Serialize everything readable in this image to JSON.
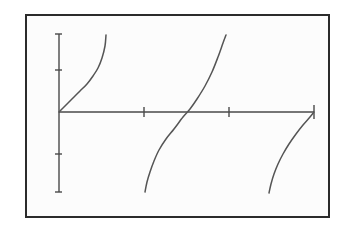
{
  "figure": {
    "name": "tangent-function-graph",
    "background_color": "#ffffff",
    "plot_background_color": "#fcfcfc",
    "border_color": "#2b2b2b",
    "axis_color": "#4a4a4a",
    "curve_color": "#555555",
    "title": "",
    "subtitle": "",
    "caption": ""
  },
  "chart_data": {
    "type": "line",
    "title": "",
    "xlabel": "",
    "ylabel": "",
    "grid": false,
    "legend": false,
    "legend_position": "none",
    "xlim": [
      0,
      4.7124
    ],
    "ylim": [
      -4,
      6
    ],
    "x_ticks": [
      0,
      1.5708,
      3.1416,
      4.7124
    ],
    "x_tick_labels": [
      "",
      "",
      "",
      ""
    ],
    "y_ticks": [
      -2,
      0,
      2
    ],
    "y_tick_labels": [
      "",
      "",
      ""
    ],
    "axis_origin_px": {
      "x": 32,
      "y": 96
    },
    "x_axis_span_px": {
      "start": 32,
      "end": 287
    },
    "y_axis_span_px": {
      "top": 18,
      "bottom": 176
    },
    "series": [
      {
        "name": "tangent-branch-1",
        "description": "rising branch from origin toward vertical asymptote",
        "points_px": [
          [
            32,
            96
          ],
          [
            36,
            92
          ],
          [
            41,
            87
          ],
          [
            47,
            81
          ],
          [
            53,
            75
          ],
          [
            60,
            68
          ],
          [
            66,
            60
          ],
          [
            71,
            52
          ],
          [
            75,
            42
          ],
          [
            78,
            30
          ],
          [
            79,
            19
          ]
        ]
      },
      {
        "name": "tangent-branch-2",
        "description": "full branch crossing the x-axis at pi",
        "points_px": [
          [
            118,
            176
          ],
          [
            120,
            166
          ],
          [
            123,
            156
          ],
          [
            127,
            145
          ],
          [
            132,
            134
          ],
          [
            139,
            123
          ],
          [
            147,
            113
          ],
          [
            156,
            101
          ],
          [
            163,
            93
          ],
          [
            170,
            83
          ],
          [
            178,
            70
          ],
          [
            185,
            56
          ],
          [
            191,
            41
          ],
          [
            196,
            27
          ],
          [
            199,
            19
          ]
        ]
      },
      {
        "name": "tangent-branch-3",
        "description": "lower branch rising to the right edge asymptote",
        "points_px": [
          [
            242,
            177
          ],
          [
            244,
            168
          ],
          [
            247,
            158
          ],
          [
            251,
            148
          ],
          [
            256,
            138
          ],
          [
            262,
            128
          ],
          [
            269,
            118
          ],
          [
            276,
            109
          ],
          [
            283,
            101
          ],
          [
            287,
            96
          ]
        ]
      }
    ],
    "x_tick_positions_px": [
      32,
      117,
      202,
      287
    ],
    "y_tick_positions_px": [
      54,
      96,
      138
    ]
  }
}
